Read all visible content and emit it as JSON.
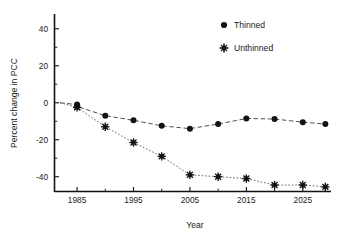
{
  "chart_data": {
    "type": "line",
    "title": "",
    "xlabel": "Year",
    "ylabel": "Percent change in PCC",
    "xlim": [
      1981,
      2030
    ],
    "ylim": [
      -48,
      48
    ],
    "xticks": [
      1985,
      1995,
      2005,
      2015,
      2025
    ],
    "yticks": [
      40,
      20,
      0,
      -20,
      -40
    ],
    "xtick_labels": [
      "1985",
      "1995",
      "2005",
      "2015",
      "2025"
    ],
    "ytick_labels": [
      "40",
      "20",
      "0",
      "-20",
      "-40"
    ],
    "grid": false,
    "legend_position": "top-right",
    "series": [
      {
        "name": "Thinned",
        "marker": "circle",
        "linestyle": "dashed",
        "x": [
          1982,
          1985,
          1985,
          1990,
          1995,
          2000,
          2005,
          2010,
          2015,
          2020,
          2025,
          2029
        ],
        "values": [
          0,
          -1,
          -2,
          -7,
          -9.5,
          -12.5,
          -14,
          -11.5,
          -8.5,
          -8.8,
          -10.5,
          -11.5
        ]
      },
      {
        "name": "Unthinned",
        "marker": "star",
        "linestyle": "dotted",
        "x": [
          1982,
          1985,
          1990,
          1995,
          2000,
          2005,
          2010,
          2015,
          2020,
          2025,
          2029
        ],
        "values": [
          0,
          -2.5,
          -13,
          -21.5,
          -29,
          -39,
          -40,
          -41,
          -44.5,
          -44.5,
          -45.5
        ]
      }
    ]
  },
  "legend": {
    "entries": [
      {
        "label": "Thinned",
        "marker": "circle"
      },
      {
        "label": "Unthinned",
        "marker": "star"
      }
    ]
  }
}
